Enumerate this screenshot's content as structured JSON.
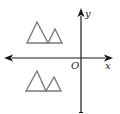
{
  "diagram": {
    "type": "coordinate-plane",
    "labels": {
      "y_axis": "y",
      "x_axis": "x",
      "origin": "O"
    },
    "colors": {
      "axis": "#1a1a1a",
      "shape_stroke": "#7a7a7a",
      "text": "#222222"
    },
    "axes": {
      "x": {
        "y": 58,
        "from": 4,
        "to": 113
      },
      "y": {
        "x": 81,
        "from": 9,
        "to": 113
      }
    },
    "shapes": [
      {
        "name": "upper-figure",
        "quadrant": "II",
        "triangles": [
          {
            "points": "37,22 27,43 48,43"
          },
          {
            "points": "55,29 48,43 62,43"
          }
        ]
      },
      {
        "name": "lower-figure",
        "quadrant": "III",
        "triangles": [
          {
            "points": "37,71 26,91 46,91"
          },
          {
            "points": "54,77 46,91 61,91"
          }
        ]
      }
    ]
  }
}
